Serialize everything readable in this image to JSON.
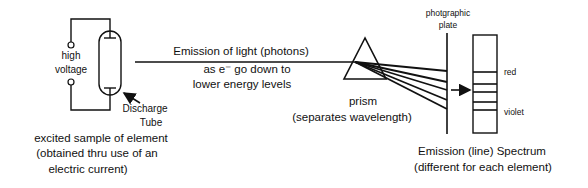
{
  "source": {
    "high_voltage_label": [
      "high",
      "voltage"
    ],
    "discharge_tube_label": [
      "Discharge",
      "Tube"
    ],
    "caption": [
      "excited sample of element",
      "(obtained thru use of an",
      "electric current)"
    ]
  },
  "beam": {
    "label": "Emission of light (photons)",
    "sublabel": [
      "as e⁻ go down to",
      "lower energy levels"
    ]
  },
  "prism": {
    "label": "prism",
    "sublabel": "(separates wavelength)"
  },
  "plate": {
    "label": [
      "photgraphic",
      "plate"
    ]
  },
  "spectrum": {
    "line_count": 5,
    "red_label": "red",
    "violet_label": "violet",
    "caption": [
      "Emission (line) Spectrum",
      "(different for each element)"
    ]
  }
}
